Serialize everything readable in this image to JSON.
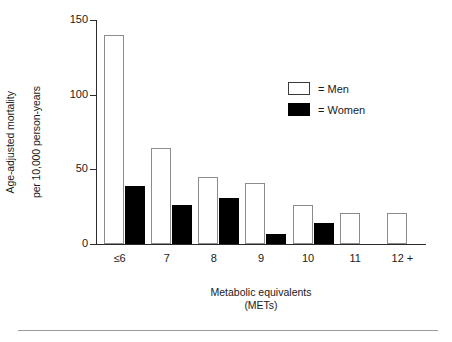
{
  "chart_data": {
    "type": "bar",
    "title": "",
    "subtitle": "",
    "categories": [
      "≤6",
      "7",
      "8",
      "9",
      "10",
      "11",
      "12 +"
    ],
    "series": [
      {
        "name": "Men",
        "values": [
          140,
          64,
          45,
          41,
          26,
          21,
          21
        ],
        "color": "#ffffff"
      },
      {
        "name": "Women",
        "values": [
          39,
          26,
          31,
          7,
          14,
          0,
          0
        ],
        "color": "#000000"
      }
    ],
    "xlabel": "Metabolic equivalents",
    "xlabel_line2": "(METs)",
    "ylabel": "Age-adjusted mortality",
    "ylabel_line2": "per 10,000 person-years",
    "ylim": [
      0,
      150
    ],
    "yticks": [
      0,
      50,
      100,
      150
    ],
    "ytick_labels": [
      "0",
      "50",
      "100",
      "150"
    ],
    "grid": false,
    "legend_position": "upper right"
  },
  "axes": {
    "y_title_line1": "Age-adjusted mortality",
    "y_title_line2": "per 10,000 person-years",
    "x_title_line1": "Metabolic equivalents",
    "x_title_line2": "(METs)"
  },
  "legend": {
    "items": [
      {
        "label": "= Men",
        "swatch": "white-square-icon"
      },
      {
        "label": "= Women",
        "swatch": "black-square-icon"
      }
    ]
  }
}
